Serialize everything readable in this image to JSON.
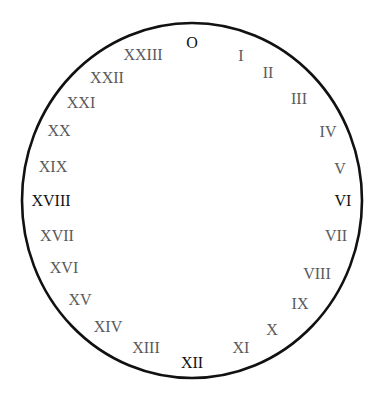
{
  "diagram": {
    "type": "24-hour roman numeral dial",
    "outline_color": "#111111",
    "label_color": "#5a5a5a",
    "labels": [
      {
        "text": "O",
        "x": 192,
        "y": 43,
        "dark": true
      },
      {
        "text": "I",
        "x": 241,
        "y": 56
      },
      {
        "text": "II",
        "x": 268,
        "y": 73
      },
      {
        "text": "III",
        "x": 299,
        "y": 99
      },
      {
        "text": "IV",
        "x": 328,
        "y": 132
      },
      {
        "text": "V",
        "x": 340,
        "y": 169
      },
      {
        "text": "VI",
        "x": 343,
        "y": 201,
        "dark": true
      },
      {
        "text": "VII",
        "x": 336,
        "y": 236
      },
      {
        "text": "VIII",
        "x": 317,
        "y": 274
      },
      {
        "text": "IX",
        "x": 300,
        "y": 304
      },
      {
        "text": "X",
        "x": 272,
        "y": 330
      },
      {
        "text": "XI",
        "x": 241,
        "y": 348
      },
      {
        "text": "XII",
        "x": 192,
        "y": 363,
        "dark": true
      },
      {
        "text": "XIII",
        "x": 146,
        "y": 348
      },
      {
        "text": "XIV",
        "x": 108,
        "y": 327
      },
      {
        "text": "XV",
        "x": 80,
        "y": 300
      },
      {
        "text": "XVI",
        "x": 64,
        "y": 268
      },
      {
        "text": "XVII",
        "x": 57,
        "y": 236
      },
      {
        "text": "XVIII",
        "x": 51,
        "y": 201,
        "dark": true
      },
      {
        "text": "XIX",
        "x": 53,
        "y": 167
      },
      {
        "text": "XX",
        "x": 59,
        "y": 131
      },
      {
        "text": "XXI",
        "x": 81,
        "y": 103
      },
      {
        "text": "XXII",
        "x": 107,
        "y": 78
      },
      {
        "text": "XXIII",
        "x": 143,
        "y": 55
      }
    ]
  }
}
